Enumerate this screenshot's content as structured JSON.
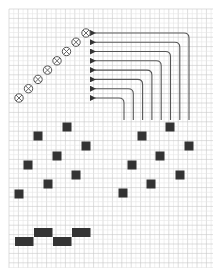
{
  "canvas": {
    "width": 223,
    "height": 279,
    "background": "#ffffff"
  },
  "grid": {
    "x0": 9,
    "y0": 9,
    "x1": 213,
    "y1": 268,
    "major_step": 9.4,
    "minor_divisions": 2,
    "major_color": "#c8c8c8",
    "minor_color": "#e6e6e6"
  },
  "colors": {
    "ink": "#333333",
    "line": "#555555",
    "circle_stroke": "#555555"
  },
  "circles": {
    "radius": 4.2,
    "items": [
      {
        "x": 19,
        "y": 98
      },
      {
        "x": 28.5,
        "y": 88.7
      },
      {
        "x": 38,
        "y": 79.4
      },
      {
        "x": 47.5,
        "y": 70.1
      },
      {
        "x": 57,
        "y": 60.8
      },
      {
        "x": 66.5,
        "y": 51.5
      },
      {
        "x": 76,
        "y": 42.2
      },
      {
        "x": 86,
        "y": 33
      }
    ]
  },
  "arrows": {
    "tip_x": 94,
    "bottom_y": 120,
    "corner_radius": 5,
    "items": [
      {
        "y": 98,
        "x": 124
      },
      {
        "y": 88.7,
        "x": 133.3
      },
      {
        "y": 79.4,
        "x": 142.6
      },
      {
        "y": 70.1,
        "x": 151.9
      },
      {
        "y": 60.8,
        "x": 161.2
      },
      {
        "y": 51.5,
        "x": 170.5
      },
      {
        "y": 42.2,
        "x": 179.8
      },
      {
        "y": 33,
        "x": 189
      }
    ]
  },
  "squares": {
    "size": 9,
    "left_group": [
      {
        "x": 19,
        "y": 194
      },
      {
        "x": 28,
        "y": 165
      },
      {
        "x": 38,
        "y": 136
      },
      {
        "x": 48,
        "y": 184
      },
      {
        "x": 57,
        "y": 156
      },
      {
        "x": 67,
        "y": 127
      },
      {
        "x": 76,
        "y": 175
      },
      {
        "x": 86,
        "y": 146
      }
    ],
    "right_group": [
      {
        "x": 123,
        "y": 193
      },
      {
        "x": 132,
        "y": 165
      },
      {
        "x": 142,
        "y": 136
      },
      {
        "x": 151,
        "y": 184
      },
      {
        "x": 160,
        "y": 156
      },
      {
        "x": 170,
        "y": 127
      },
      {
        "x": 180,
        "y": 175
      },
      {
        "x": 189,
        "y": 146
      }
    ]
  },
  "bars": {
    "items": [
      {
        "x": 15,
        "y": 237,
        "w": 18.5,
        "h": 9
      },
      {
        "x": 34,
        "y": 228,
        "w": 18.5,
        "h": 9
      },
      {
        "x": 53,
        "y": 237,
        "w": 18.5,
        "h": 9
      },
      {
        "x": 72,
        "y": 228,
        "w": 18.5,
        "h": 9
      }
    ]
  }
}
